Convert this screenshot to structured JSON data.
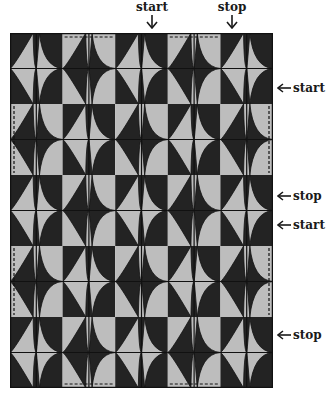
{
  "figure": {
    "colors": {
      "dark": "#232323",
      "light": "#bdbdbd",
      "line": "#111111"
    },
    "quilt": {
      "columns": 5,
      "rows": 5,
      "x": 10,
      "y": 33,
      "width": 263,
      "height": 355,
      "pattern": "checkerboard-dark-on-even"
    },
    "top_labels": [
      {
        "text": "start",
        "x": 152,
        "arrow": "down"
      },
      {
        "text": "stop",
        "x": 232,
        "arrow": "down"
      }
    ],
    "side_labels": [
      {
        "text": "start",
        "y": 88,
        "arrow": "left"
      },
      {
        "text": "stop",
        "y": 196,
        "arrow": "left"
      },
      {
        "text": "start",
        "y": 225,
        "arrow": "left"
      },
      {
        "text": "stop",
        "y": 335,
        "arrow": "left"
      }
    ]
  }
}
